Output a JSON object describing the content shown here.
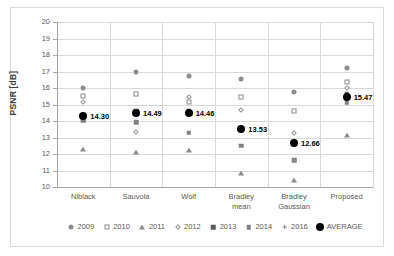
{
  "chart_data": {
    "type": "scatter",
    "title": "",
    "xlabel": "",
    "ylabel": "PSNR [dB]",
    "ylim": [
      10,
      20
    ],
    "ytick_step": 1,
    "yticks": [
      "20",
      "19",
      "18",
      "17",
      "16",
      "15",
      "14",
      "13",
      "12",
      "11",
      "10"
    ],
    "grid": true,
    "legend_position": "bottom",
    "categories": [
      "Niblack",
      "Sauvola",
      "Wolf",
      "Bradley\nmean",
      "Bradley\nGaussian",
      "Proposed"
    ],
    "category_labels": [
      {
        "line1": "Niblack",
        "line2": ""
      },
      {
        "line1": "Sauvola",
        "line2": ""
      },
      {
        "line1": "Wolf",
        "line2": ""
      },
      {
        "line1": "Bradley",
        "line2": "mean"
      },
      {
        "line1": "Bradley",
        "line2": "Gaussian"
      },
      {
        "line1": "Proposed",
        "line2": ""
      }
    ],
    "series": [
      {
        "name": "2009",
        "marker": "sunburst-dot",
        "values": [
          16.03,
          17.0,
          16.7,
          16.53,
          15.78,
          17.2
        ]
      },
      {
        "name": "2010",
        "marker": "open-square",
        "values": [
          15.52,
          15.62,
          15.15,
          15.47,
          14.58,
          16.38
        ]
      },
      {
        "name": "2011",
        "marker": "triangle",
        "values": [
          12.3,
          12.13,
          12.23,
          10.85,
          10.42,
          13.17
        ]
      },
      {
        "name": "2012",
        "marker": "open-diamond",
        "values": [
          15.15,
          13.33,
          15.48,
          14.65,
          13.28,
          16.0
        ]
      },
      {
        "name": "2013",
        "marker": "filled-square",
        "values": [
          14.18,
          14.62,
          14.58,
          13.53,
          12.66,
          15.62
        ]
      },
      {
        "name": "2014",
        "marker": "grey-square",
        "values": [
          14.05,
          13.93,
          13.3,
          12.5,
          11.62,
          15.13
        ]
      },
      {
        "name": "2016",
        "marker": "plus",
        "values": [
          14.3,
          14.49,
          14.46,
          13.53,
          11.58,
          15.47
        ]
      },
      {
        "name": "AVERAGE",
        "marker": "filled-circle",
        "values": [
          14.3,
          14.49,
          14.46,
          13.53,
          12.66,
          15.47
        ]
      }
    ],
    "average_labels": [
      "14.30",
      "14.49",
      "14.46",
      "13.53",
      "12.66",
      "15.47"
    ]
  },
  "legend": {
    "entries": [
      {
        "label": "2009"
      },
      {
        "label": "2010"
      },
      {
        "label": "2011"
      },
      {
        "label": "2012"
      },
      {
        "label": "2013"
      },
      {
        "label": "2014"
      },
      {
        "label": "2016"
      },
      {
        "label": "AVERAGE"
      }
    ]
  },
  "colors": {
    "marker_grey": "#8c8c8c",
    "marker_dark": "#595959",
    "average": "#000000",
    "gridline": "#d9d9d9",
    "axis": "#a6a6a6",
    "text": "#595959",
    "background": "#ffffff"
  }
}
